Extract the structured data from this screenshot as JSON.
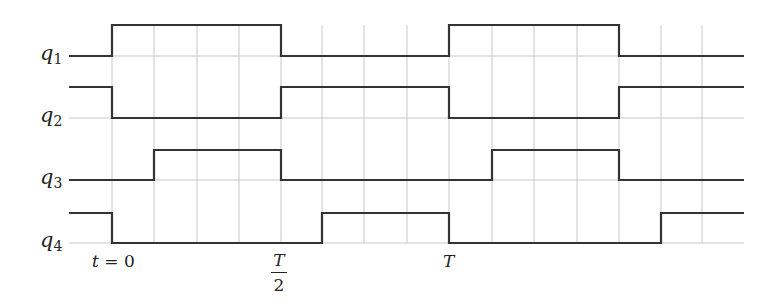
{
  "colors": {
    "signal": "#333333",
    "grid": "#c8c8c8",
    "background": "#ffffff",
    "text": "#222222"
  },
  "signals": [
    {
      "name": "q",
      "sub": "1",
      "label_y": 56,
      "high_y": 25,
      "low_y": 56,
      "points": [
        [
          69,
          "L"
        ],
        [
          112,
          "H"
        ],
        [
          281,
          "L"
        ],
        [
          449,
          "H"
        ],
        [
          619,
          "L"
        ],
        [
          744,
          "L"
        ]
      ]
    },
    {
      "name": "q",
      "sub": "2",
      "label_y": 118,
      "high_y": 87,
      "low_y": 118,
      "points": [
        [
          69,
          "H"
        ],
        [
          112,
          "L"
        ],
        [
          281,
          "H"
        ],
        [
          449,
          "L"
        ],
        [
          619,
          "H"
        ],
        [
          744,
          "H"
        ]
      ]
    },
    {
      "name": "q",
      "sub": "3",
      "label_y": 180,
      "high_y": 150,
      "low_y": 180,
      "points": [
        [
          69,
          "L"
        ],
        [
          154,
          "H"
        ],
        [
          281,
          "L"
        ],
        [
          492,
          "H"
        ],
        [
          619,
          "L"
        ],
        [
          744,
          "L"
        ]
      ]
    },
    {
      "name": "q",
      "sub": "4",
      "label_y": 243,
      "high_y": 213,
      "low_y": 243,
      "points": [
        [
          69,
          "H"
        ],
        [
          112,
          "L"
        ],
        [
          322,
          "H"
        ],
        [
          449,
          "L"
        ],
        [
          661,
          "H"
        ],
        [
          744,
          "H"
        ]
      ]
    }
  ],
  "grid": {
    "vertical_x": [
      112,
      154,
      197,
      239,
      281,
      322,
      364,
      407,
      449,
      492,
      534,
      577,
      619,
      661,
      702
    ],
    "vertical_y_range": [
      25,
      243
    ],
    "horizontal_y": [
      56,
      118,
      180,
      243
    ],
    "horizontal_x_range": [
      69,
      744
    ]
  },
  "time_labels": {
    "t0": {
      "var": "t",
      "eq": " = 0",
      "x": 112
    },
    "half": {
      "num": "T",
      "den": "2",
      "x": 281
    },
    "full": {
      "var": "T",
      "x": 449
    }
  }
}
